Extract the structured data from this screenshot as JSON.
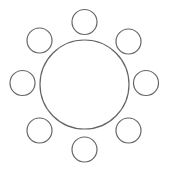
{
  "diagram": {
    "stroke_color": "#666666",
    "fill_color": "#ffffff",
    "table": {
      "cx": 84.5,
      "cy": 84.5,
      "r": 44.5
    },
    "chairs": [
      {
        "position": "top",
        "cx": 84.5,
        "cy": 22,
        "r": 12.5
      },
      {
        "position": "top-right",
        "cx": 128.5,
        "cy": 41.5,
        "r": 12.5
      },
      {
        "position": "right",
        "cx": 146,
        "cy": 83,
        "r": 12.5
      },
      {
        "position": "bottom-right",
        "cx": 128.5,
        "cy": 130.5,
        "r": 12.5
      },
      {
        "position": "bottom",
        "cx": 84.5,
        "cy": 149.5,
        "r": 12.5
      },
      {
        "position": "bottom-left",
        "cx": 39.5,
        "cy": 130.5,
        "r": 12.5
      },
      {
        "position": "left",
        "cx": 22.5,
        "cy": 83,
        "r": 12.5
      },
      {
        "position": "top-left",
        "cx": 39.5,
        "cy": 40.5,
        "r": 12.5
      }
    ]
  }
}
